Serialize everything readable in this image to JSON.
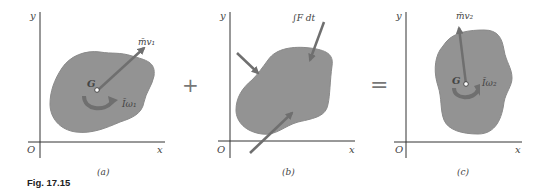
{
  "figure": {
    "caption": "Fig. 17.15",
    "colors": {
      "body_fill": "#939393",
      "body_stroke": "#8a8a8a",
      "arrow": "#6f6f6f",
      "axis": "#333333",
      "text": "#444444"
    },
    "panels": [
      {
        "id": "a",
        "label": "(a)",
        "axis_x": "x",
        "axis_y": "y",
        "origin": "O",
        "centroid": "G",
        "momentum_label": "m̄v₁",
        "angular_label": "Īω₁"
      },
      {
        "id": "b",
        "label": "(b)",
        "axis_x": "x",
        "axis_y": "y",
        "origin": "O",
        "impulse_label": "∫F dt"
      },
      {
        "id": "c",
        "label": "(c)",
        "axis_x": "x",
        "axis_y": "y",
        "origin": "O",
        "centroid": "G",
        "momentum_label": "m̄v₂",
        "angular_label": "Īω₂"
      }
    ],
    "operators": [
      "+",
      "="
    ]
  }
}
